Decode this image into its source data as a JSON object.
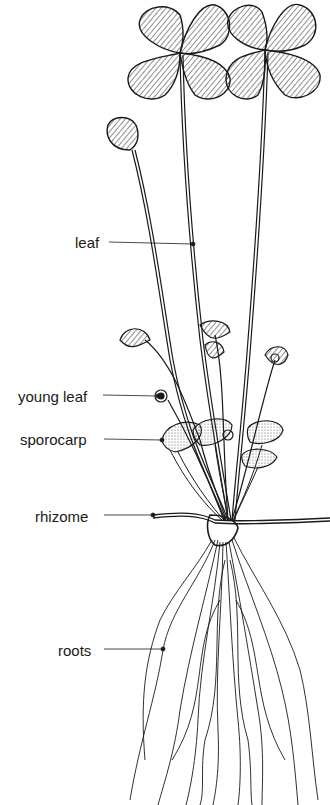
{
  "diagram": {
    "labels": [
      {
        "id": "leaf",
        "text": "leaf",
        "x": 75,
        "y": 235,
        "pointer": {
          "x1": 109,
          "y1": 242,
          "x2": 193,
          "y2": 244
        }
      },
      {
        "id": "young-leaf",
        "text": "young leaf",
        "x": 18,
        "y": 391,
        "pointer": {
          "x1": 103,
          "y1": 395,
          "x2": 161,
          "y2": 396
        }
      },
      {
        "id": "sporocarp",
        "text": "sporocarp",
        "x": 20,
        "y": 432,
        "pointer": {
          "x1": 104,
          "y1": 439,
          "x2": 162,
          "y2": 440
        }
      },
      {
        "id": "rhizome",
        "text": "rhizome",
        "x": 35,
        "y": 511,
        "pointer": {
          "x1": 104,
          "y1": 515,
          "x2": 153,
          "y2": 515
        }
      },
      {
        "id": "roots",
        "text": "roots",
        "x": 58,
        "y": 645,
        "pointer": {
          "x1": 104,
          "y1": 649,
          "x2": 163,
          "y2": 649
        }
      }
    ]
  },
  "colors": {
    "ink": "#1a1a1a",
    "background": "#ffffff",
    "sporocarp_fill": "#e8e4dc"
  }
}
